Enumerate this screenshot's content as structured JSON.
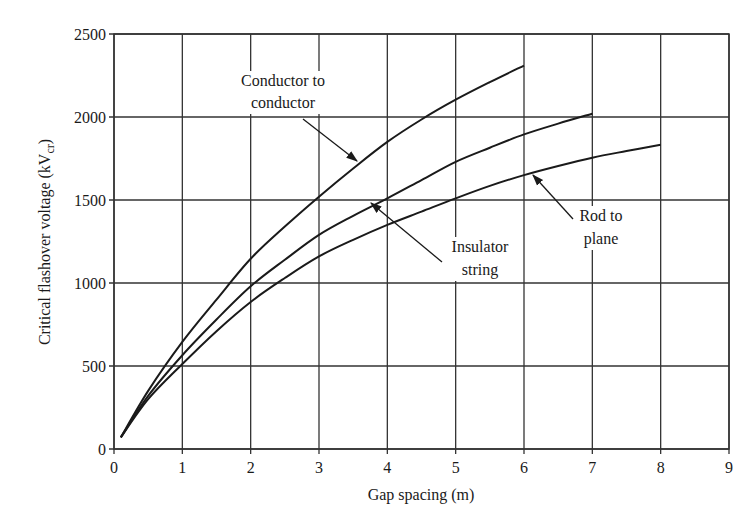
{
  "chart_data": {
    "type": "line",
    "title": "",
    "xlabel": "Gap spacing (m)",
    "ylabel": "Critical flashover voltage (kV",
    "ylabel_subscript": "cr",
    "ylabel_suffix": ")",
    "xlim": [
      0,
      9
    ],
    "ylim": [
      0,
      2500
    ],
    "x_ticks": [
      0,
      1,
      2,
      3,
      4,
      5,
      6,
      7,
      8,
      9
    ],
    "y_ticks": [
      0,
      500,
      1000,
      1500,
      2000,
      2500
    ],
    "grid": true,
    "legend": "none (inline annotations with arrows)",
    "series": [
      {
        "name": "Conductor to conductor",
        "label_lines": [
          "Conductor to",
          "conductor"
        ],
        "x": [
          0.1,
          0.5,
          1,
          1.5,
          2,
          2.5,
          3,
          3.5,
          4,
          4.5,
          5,
          5.5,
          6
        ],
        "values": [
          70,
          350,
          645,
          900,
          1146,
          1340,
          1520,
          1690,
          1850,
          1985,
          2104,
          2210,
          2310
        ]
      },
      {
        "name": "Insulator string",
        "label_lines": [
          "Insulator",
          "string"
        ],
        "x": [
          0.1,
          0.5,
          1,
          1.5,
          2,
          2.5,
          3,
          3.5,
          4,
          4.5,
          5,
          5.5,
          6,
          6.5,
          7
        ],
        "values": [
          70,
          320,
          565,
          780,
          980,
          1140,
          1290,
          1405,
          1510,
          1620,
          1730,
          1815,
          1895,
          1960,
          2020
        ]
      },
      {
        "name": "Rod to plane",
        "label_lines": [
          "Rod to",
          "plane"
        ],
        "x": [
          0.1,
          0.5,
          1,
          1.5,
          2,
          2.5,
          3,
          3.5,
          4,
          4.5,
          5,
          5.5,
          6,
          6.5,
          7,
          7.5,
          8
        ],
        "values": [
          70,
          300,
          512,
          710,
          886,
          1030,
          1160,
          1260,
          1350,
          1430,
          1510,
          1585,
          1650,
          1705,
          1755,
          1795,
          1833
        ]
      }
    ],
    "annotations": [
      {
        "series": "Conductor to conductor",
        "text_lines": [
          "Conductor to",
          "conductor"
        ],
        "text_x": 283,
        "text_y": [
          86,
          108
        ],
        "arrow_from": [
          303,
          119
        ],
        "arrow_to": [
          357,
          161
        ]
      },
      {
        "series": "Insulator string",
        "text_lines": [
          "Insulator",
          "string"
        ],
        "text_x": 480,
        "text_y": [
          252,
          275
        ],
        "arrow_from": [
          442,
          262
        ],
        "arrow_to": [
          371,
          203
        ]
      },
      {
        "series": "Rod to plane",
        "text_lines": [
          "Rod to",
          "plane"
        ],
        "text_x": 601,
        "text_y": [
          221,
          244
        ],
        "arrow_from": [
          573,
          219
        ],
        "arrow_to": [
          533,
          175
        ]
      }
    ],
    "colors": {
      "line": "#1a1a1a",
      "grid": "#333333",
      "background": "#ffffff"
    }
  }
}
